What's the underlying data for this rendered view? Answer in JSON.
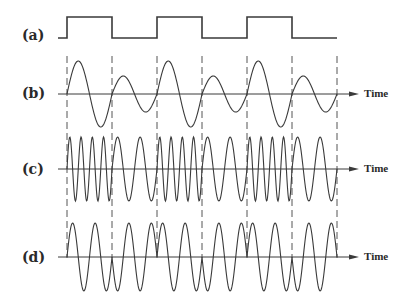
{
  "figure": {
    "rows": [
      {
        "id": "a",
        "label": "(a)",
        "kind": "square",
        "axis_y": 38,
        "label_y": 28,
        "time_label": ""
      },
      {
        "id": "b",
        "label": "(b)",
        "kind": "am",
        "axis_y": 94,
        "label_y": 86,
        "time_label": "Time"
      },
      {
        "id": "c",
        "label": "(c)",
        "kind": "fm",
        "axis_y": 169,
        "label_y": 161,
        "time_label": "Time"
      },
      {
        "id": "d",
        "label": "(d)",
        "kind": "pm",
        "axis_y": 257,
        "label_y": 249,
        "time_label": "Time"
      }
    ],
    "bits": [
      1,
      0,
      1,
      0,
      1,
      0
    ],
    "bit_boundaries_x": [
      67,
      112,
      157,
      202,
      247,
      292,
      337
    ],
    "square": {
      "start_x": 58,
      "end_x": 337,
      "high_y": 17,
      "low_y": 38
    },
    "am": {
      "amp_high": 33,
      "amp_low": 18,
      "cycles_per_bit": 1
    },
    "fm": {
      "amp": 32,
      "cycles_high": 4,
      "cycles_low": 2
    },
    "pm": {
      "amp": 34,
      "cycles_per_bit": 2
    },
    "axis": {
      "start_x": 58,
      "arrow_tip_x": 359
    },
    "dashes": {
      "top_y": 56,
      "bottom_y": 258
    },
    "colors": {
      "ink": "#3a3a3a",
      "dash": "#555555",
      "background": "#ffffff"
    }
  }
}
